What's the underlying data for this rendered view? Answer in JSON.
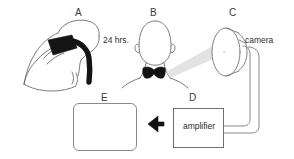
{
  "figure": {
    "type": "scientific-diagram",
    "background_color": "#ffffff",
    "ink_color": "#555555",
    "fill_color": "#111111",
    "width": 294,
    "height": 159
  },
  "panels": [
    {
      "id": "A",
      "label": "A",
      "name": "patch-application",
      "description": "hand applying dark patch to shoulder and neck of a person seen from behind"
    },
    {
      "id": "B",
      "label": "B",
      "name": "head-neck-uptake",
      "description": "head and neck from behind with butterfly shaped dark mark at the thyroid"
    },
    {
      "id": "C",
      "label": "C",
      "name": "gamma-camera",
      "description": "cylindrical camera detector head with two cables"
    },
    {
      "id": "D",
      "label": "D",
      "name": "amplifier-unit",
      "description": "rectangular box labelled amplifier"
    },
    {
      "id": "E",
      "label": "E",
      "name": "scan-display",
      "description": "rounded display screen showing a pixelated butterfly shaped scan"
    }
  ],
  "labels": {
    "elapsed_time": "24 hrs.",
    "camera": "camera",
    "amplifier": "amplifier"
  },
  "arrow": {
    "name": "flow-arrow",
    "direction": "left",
    "from": "D",
    "to": "E"
  }
}
